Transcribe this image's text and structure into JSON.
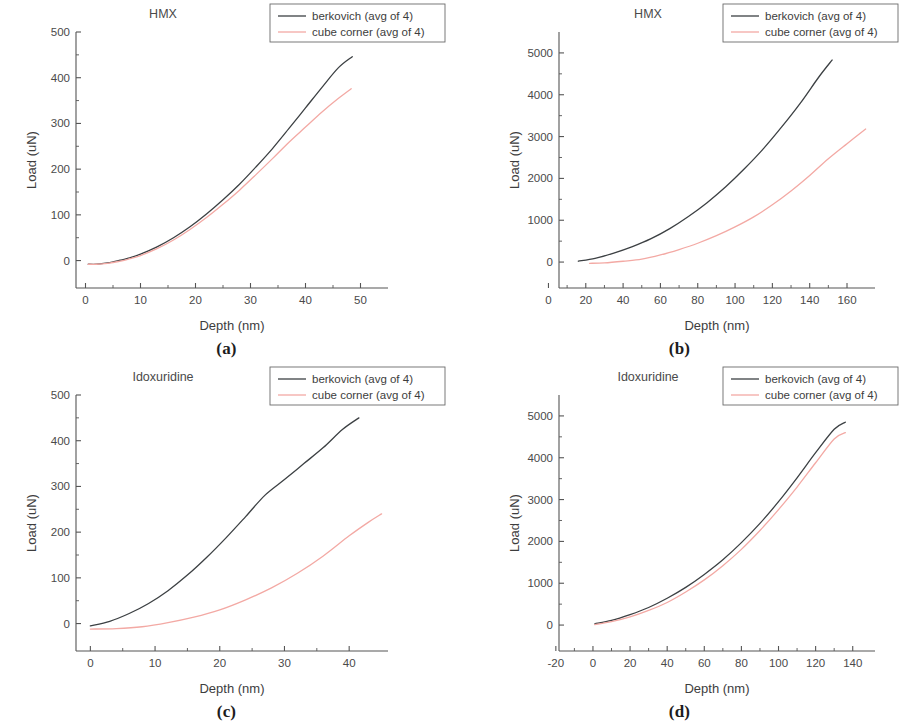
{
  "figure": {
    "panels": [
      {
        "key": "a",
        "caption": "(a)",
        "title": "HMX",
        "xlabel": "Depth (nm)",
        "ylabel": "Load (uN)",
        "xticks": [
          0,
          10,
          20,
          30,
          40,
          50
        ],
        "yticks": [
          0,
          100,
          200,
          300,
          400,
          500
        ],
        "xlim": [
          -5,
          55
        ],
        "ylim": [
          -60,
          500
        ],
        "minor_x_divisions": 2,
        "minor_y_divisions": 2,
        "legend_position": "top-right",
        "legend": [
          {
            "label": "berkovich (avg of 4)",
            "color": "#3c4043"
          },
          {
            "label": "cube corner (avg of 4)",
            "color": "#f3a9a4"
          }
        ]
      },
      {
        "key": "b",
        "caption": "(b)",
        "title": "HMX",
        "xlabel": "Depth (nm)",
        "ylabel": "Load (uN)",
        "xticks": [
          0,
          20,
          40,
          60,
          80,
          100,
          120,
          140,
          160
        ],
        "yticks": [
          0,
          1000,
          2000,
          3000,
          4000,
          5000
        ],
        "xlim": [
          -4,
          175
        ],
        "ylim": [
          -620,
          5500
        ],
        "minor_x_divisions": 2,
        "minor_y_divisions": 2,
        "legend_position": "top-right",
        "legend": [
          {
            "label": "berkovich (avg of 4)",
            "color": "#3c4043"
          },
          {
            "label": "cube corner (avg of 4)",
            "color": "#f3a9a4"
          }
        ]
      },
      {
        "key": "c",
        "caption": "(c)",
        "title": "Idoxuridine",
        "xlabel": "Depth (nm)",
        "ylabel": "Load (uN)",
        "xticks": [
          0,
          10,
          20,
          30,
          40
        ],
        "yticks": [
          0,
          100,
          200,
          300,
          400,
          500
        ],
        "xlim": [
          -5,
          46
        ],
        "ylim": [
          -60,
          500
        ],
        "minor_x_divisions": 2,
        "minor_y_divisions": 2,
        "legend_position": "top-right",
        "legend": [
          {
            "label": "berkovich (avg of 4)",
            "color": "#3c4043"
          },
          {
            "label": "cube corner (avg of 4)",
            "color": "#f3a9a4"
          }
        ]
      },
      {
        "key": "d",
        "caption": "(d)",
        "title": "Idoxuridine",
        "xlabel": "Depth (nm)",
        "ylabel": "Load (uN)",
        "xticks": [
          -20,
          0,
          20,
          40,
          60,
          80,
          100,
          120,
          140
        ],
        "yticks": [
          0,
          1000,
          2000,
          3000,
          4000,
          5000
        ],
        "xlim": [
          -28,
          152
        ],
        "ylim": [
          -620,
          5500
        ],
        "minor_x_divisions": 2,
        "minor_y_divisions": 2,
        "legend_position": "top-right",
        "legend": [
          {
            "label": "berkovich (avg of 4)",
            "color": "#3c4043"
          },
          {
            "label": "cube corner (avg of 4)",
            "color": "#f3a9a4"
          }
        ]
      }
    ]
  },
  "chart_data": [
    {
      "panel": "a",
      "type": "line",
      "title": "HMX",
      "xlabel": "Depth (nm)",
      "ylabel": "Load (uN)",
      "xlim": [
        -5,
        55
      ],
      "ylim": [
        -60,
        500
      ],
      "grid": false,
      "legend_position": "top-right",
      "series": [
        {
          "name": "berkovich (avg of 4)",
          "color": "#3c4043",
          "x": [
            0.5,
            2,
            4,
            6,
            8,
            10,
            13,
            16,
            19,
            22,
            25,
            28,
            31,
            34,
            37,
            40,
            43,
            46,
            48.5
          ],
          "y": [
            -8,
            -8,
            -5,
            0,
            6,
            14,
            30,
            50,
            74,
            102,
            133,
            167,
            205,
            245,
            289,
            334,
            379,
            422,
            446
          ]
        },
        {
          "name": "cube corner (avg of 4)",
          "color": "#f3a9a4",
          "x": [
            0.5,
            2,
            4,
            6,
            8,
            10,
            13,
            16,
            19,
            22,
            25,
            28,
            31,
            34,
            37,
            40,
            43,
            46,
            48.3
          ],
          "y": [
            -8,
            -8,
            -6,
            -2,
            4,
            11,
            26,
            45,
            68,
            94,
            123,
            154,
            188,
            223,
            259,
            292,
            325,
            355,
            376
          ]
        }
      ]
    },
    {
      "panel": "b",
      "type": "line",
      "title": "HMX",
      "xlabel": "Depth (nm)",
      "ylabel": "Load (uN)",
      "xlim": [
        -4,
        175
      ],
      "ylim": [
        -620,
        5500
      ],
      "grid": false,
      "legend_position": "top-right",
      "series": [
        {
          "name": "berkovich (avg of 4)",
          "color": "#3c4043",
          "x": [
            16,
            25,
            35,
            45,
            55,
            65,
            75,
            85,
            95,
            105,
            115,
            125,
            135,
            145,
            152
          ],
          "y": [
            20,
            90,
            215,
            370,
            560,
            800,
            1090,
            1420,
            1800,
            2230,
            2700,
            3230,
            3800,
            4430,
            4830
          ]
        },
        {
          "name": "cube corner (avg of 4)",
          "color": "#f3a9a4",
          "x": [
            22,
            30,
            40,
            50,
            60,
            70,
            80,
            90,
            100,
            110,
            120,
            130,
            140,
            150,
            160,
            170
          ],
          "y": [
            -30,
            -20,
            20,
            70,
            170,
            300,
            450,
            630,
            840,
            1080,
            1370,
            1700,
            2070,
            2470,
            2830,
            3180
          ]
        }
      ]
    },
    {
      "panel": "c",
      "type": "line",
      "title": "Idoxuridine",
      "xlabel": "Depth (nm)",
      "ylabel": "Load (uN)",
      "xlim": [
        -5,
        46
      ],
      "ylim": [
        -60,
        500
      ],
      "grid": false,
      "legend_position": "top-right",
      "series": [
        {
          "name": "berkovich (avg of 4)",
          "color": "#3c4043",
          "x": [
            0,
            3,
            6,
            9,
            12,
            15,
            18,
            21,
            24,
            27,
            30,
            33,
            36,
            39,
            41.5
          ],
          "y": [
            -5,
            5,
            22,
            44,
            72,
            106,
            145,
            188,
            234,
            281,
            315,
            350,
            385,
            425,
            450
          ]
        },
        {
          "name": "cube corner (avg of 4)",
          "color": "#f3a9a4",
          "x": [
            0,
            4,
            8,
            12,
            16,
            20,
            24,
            28,
            32,
            36,
            40,
            43,
            45
          ],
          "y": [
            -12,
            -11,
            -7,
            2,
            14,
            30,
            52,
            78,
            110,
            148,
            192,
            222,
            240
          ]
        }
      ]
    },
    {
      "panel": "d",
      "type": "line",
      "title": "Idoxuridine",
      "xlabel": "Depth (nm)",
      "ylabel": "Load (uN)",
      "xlim": [
        -28,
        152
      ],
      "ylim": [
        -620,
        5500
      ],
      "grid": false,
      "legend_position": "top-right",
      "series": [
        {
          "name": "berkovich (avg of 4)",
          "color": "#3c4043",
          "x": [
            1,
            10,
            20,
            30,
            40,
            50,
            60,
            70,
            80,
            90,
            100,
            110,
            120,
            130,
            136
          ],
          "y": [
            30,
            110,
            250,
            420,
            640,
            900,
            1210,
            1560,
            1970,
            2430,
            2950,
            3520,
            4120,
            4680,
            4850
          ]
        },
        {
          "name": "cube corner (avg of 4)",
          "color": "#f3a9a4",
          "x": [
            1,
            10,
            20,
            30,
            40,
            50,
            60,
            70,
            80,
            90,
            100,
            110,
            120,
            130,
            136
          ],
          "y": [
            10,
            80,
            195,
            350,
            540,
            790,
            1080,
            1420,
            1810,
            2260,
            2760,
            3300,
            3880,
            4450,
            4600
          ]
        }
      ]
    }
  ]
}
